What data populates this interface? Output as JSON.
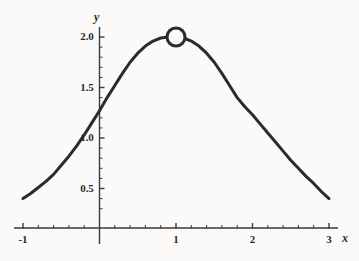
{
  "chart_data": {
    "type": "line",
    "title": "",
    "subtitle": "",
    "xlabel": "x",
    "ylabel": "y",
    "xlim": [
      -1.15,
      3.25
    ],
    "ylim": [
      0.0,
      2.12
    ],
    "grid": false,
    "legend": null,
    "x_ticks_major": [
      -1,
      1,
      2,
      3
    ],
    "x_tick_labels": [
      "-1",
      "1",
      "2",
      "3"
    ],
    "x_ticks_minor_step": 0.2,
    "y_ticks_major": [
      0.5,
      1.0,
      1.5,
      2.0
    ],
    "y_tick_labels": [
      "0.5",
      "1.0",
      "1.5",
      "2.0"
    ],
    "y_ticks_minor_step": 0.1,
    "series": [
      {
        "name": "curve",
        "style": "solid",
        "color": "#2b2b2b",
        "linewidth": 3,
        "x": [
          -1.0,
          -0.9,
          -0.8,
          -0.7,
          -0.6,
          -0.5,
          -0.4,
          -0.3,
          -0.2,
          -0.1,
          0.0,
          0.1,
          0.2,
          0.3,
          0.4,
          0.5,
          0.6,
          0.7,
          0.8,
          0.9,
          1.0,
          1.1,
          1.2,
          1.3,
          1.4,
          1.5,
          1.6,
          1.7,
          1.8,
          1.9,
          2.0,
          2.1,
          2.2,
          2.3,
          2.4,
          2.5,
          2.6,
          2.7,
          2.8,
          2.9,
          3.0
        ],
        "y": [
          0.4,
          0.45,
          0.51,
          0.57,
          0.64,
          0.73,
          0.82,
          0.92,
          1.03,
          1.15,
          1.27,
          1.4,
          1.52,
          1.64,
          1.75,
          1.84,
          1.91,
          1.96,
          1.99,
          2.0,
          2.0,
          1.99,
          1.96,
          1.91,
          1.84,
          1.75,
          1.64,
          1.52,
          1.4,
          1.31,
          1.23,
          1.14,
          1.05,
          0.96,
          0.87,
          0.78,
          0.7,
          0.62,
          0.55,
          0.47,
          0.4
        ]
      }
    ],
    "markers": [
      {
        "name": "peak-marker",
        "shape": "open-circle",
        "x": 1.0,
        "y": 2.0,
        "radius_px": 9,
        "stroke": "#2b2b2b",
        "fill": "#fbfaf8",
        "stroke_width": 3
      }
    ],
    "axes_color": "#3a3a3a",
    "background_color": "#fbfaf8"
  }
}
